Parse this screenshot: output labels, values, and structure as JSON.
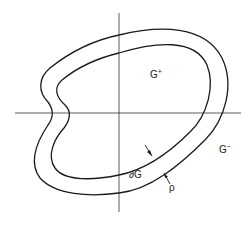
{
  "labels": {
    "region_inside": {
      "base": "G",
      "sup": "+"
    },
    "region_outside": {
      "base": "G",
      "sup": "−"
    },
    "boundary": "∂G",
    "width": "ρ"
  },
  "colors": {
    "stroke": "#1a1a1a",
    "background": "#ffffff"
  }
}
